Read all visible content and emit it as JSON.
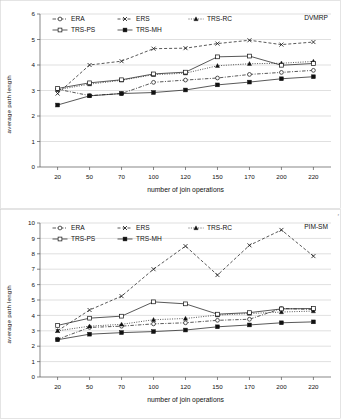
{
  "figure": {
    "corner_mark": "r"
  },
  "chart_data": [
    {
      "type": "line",
      "title": "DVMRP",
      "panel_label": "DVMRP",
      "xlabel": "number of join operations",
      "ylabel": "average path length",
      "categories": [
        "20",
        "50",
        "70",
        "100",
        "120",
        "150",
        "170",
        "200",
        "220"
      ],
      "ylim": [
        0,
        6
      ],
      "yticks": [
        "0",
        "1",
        "2",
        "3",
        "4",
        "5",
        "6"
      ],
      "grid": true,
      "legend_position": "top-left",
      "series": [
        {
          "name": "ERA",
          "marker": "circle-open",
          "line": "dash-dot",
          "values": [
            3.05,
            2.8,
            2.88,
            3.32,
            3.41,
            3.49,
            3.63,
            3.71,
            3.79
          ]
        },
        {
          "name": "ERS",
          "marker": "x",
          "line": "dashed",
          "values": [
            2.88,
            4.0,
            4.15,
            4.64,
            4.66,
            4.84,
            4.97,
            4.8,
            4.9
          ]
        },
        {
          "name": "TRS-RC",
          "marker": "triangle-solid",
          "line": "dotted",
          "values": [
            3.03,
            3.25,
            3.4,
            3.62,
            3.68,
            3.97,
            4.05,
            4.07,
            4.14
          ]
        },
        {
          "name": "TRS-PS",
          "marker": "square-open",
          "line": "solid",
          "values": [
            3.08,
            3.3,
            3.42,
            3.65,
            3.72,
            4.32,
            4.35,
            3.99,
            4.06
          ]
        },
        {
          "name": "TRS-MH",
          "marker": "square-solid",
          "line": "solid",
          "values": [
            2.43,
            2.79,
            2.88,
            2.92,
            3.02,
            3.22,
            3.33,
            3.46,
            3.54
          ]
        }
      ]
    },
    {
      "type": "line",
      "title": "PIM-SM",
      "panel_label": "PIM-SM",
      "xlabel": "number of join operations",
      "ylabel": "average path length",
      "categories": [
        "20",
        "50",
        "70",
        "100",
        "120",
        "150",
        "170",
        "200",
        "220"
      ],
      "ylim": [
        0,
        10
      ],
      "yticks": [
        "0",
        "1",
        "2",
        "3",
        "4",
        "5",
        "6",
        "7",
        "8",
        "9",
        "10"
      ],
      "grid": true,
      "legend_position": "top-left",
      "series": [
        {
          "name": "ERA",
          "marker": "circle-open",
          "line": "dash-dot",
          "values": [
            2.45,
            3.22,
            3.3,
            3.45,
            3.52,
            3.68,
            3.75,
            4.45,
            4.38
          ]
        },
        {
          "name": "ERS",
          "marker": "x",
          "line": "dashed",
          "values": [
            3.0,
            4.35,
            5.25,
            7.0,
            8.5,
            6.62,
            8.55,
            9.55,
            7.85
          ]
        },
        {
          "name": "TRS-RC",
          "marker": "triangle-solid",
          "line": "dotted",
          "values": [
            3.0,
            3.3,
            3.42,
            3.72,
            3.8,
            4.02,
            4.12,
            4.22,
            4.28
          ]
        },
        {
          "name": "TRS-PS",
          "marker": "square-open",
          "line": "solid",
          "values": [
            3.35,
            3.82,
            3.95,
            4.88,
            4.75,
            4.08,
            4.18,
            4.42,
            4.45
          ]
        },
        {
          "name": "TRS-MH",
          "marker": "square-solid",
          "line": "solid",
          "values": [
            2.42,
            2.78,
            2.88,
            2.95,
            3.05,
            3.26,
            3.38,
            3.52,
            3.58
          ]
        }
      ]
    }
  ]
}
